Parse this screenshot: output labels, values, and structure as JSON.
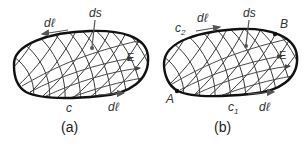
{
  "figures": [
    {
      "id": "a",
      "caption": "(a)",
      "labels": {
        "dl_top": "dℓ",
        "ds": "ds",
        "field": "E",
        "contour": "c",
        "dl_bottom": "dℓ"
      }
    },
    {
      "id": "b",
      "caption": "(b)",
      "labels": {
        "contour_top": "c",
        "contour_top_sub": "2",
        "dl_top": "dℓ",
        "ds": "ds",
        "point_b": "B",
        "field": "E",
        "point_a": "A",
        "contour_bottom": "c",
        "contour_bottom_sub": "1",
        "dl_bottom": "dℓ"
      }
    }
  ],
  "colors": {
    "outline": "#111111",
    "mesh": "#3a3a3a",
    "label": "#333333"
  }
}
